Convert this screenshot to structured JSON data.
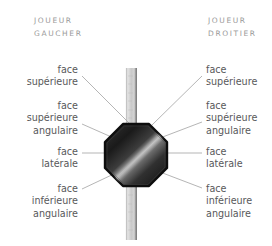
{
  "diagram": {
    "title_left": {
      "line1": "JOUEUR",
      "line2": "GAUCHER"
    },
    "title_right": {
      "line1": "JOUEUR",
      "line2": "DROITIER"
    },
    "colors": {
      "background": "#ffffff",
      "heading_text": "#9a9a9a",
      "label_text": "#58585a",
      "leader_line": "#a8a8a8",
      "bar_light": "#d9d9d9",
      "bar_mid": "#c4c4c4",
      "bar_dark": "#8e8e8e",
      "octagon_outline": "#0d0d0d",
      "octagon_dark": "#1b1b1b",
      "octagon_highlight": "#b9b9b9"
    },
    "labels_left": [
      {
        "id": "face-superieure",
        "lines": [
          "face",
          "supérieure"
        ]
      },
      {
        "id": "face-superieure-angulaire",
        "lines": [
          "face",
          "supérieure",
          "angulaire"
        ]
      },
      {
        "id": "face-laterale",
        "lines": [
          "face",
          "latérale"
        ]
      },
      {
        "id": "face-inferieure-angulaire",
        "lines": [
          "face",
          "inférieure",
          "angulaire"
        ]
      }
    ],
    "labels_right": [
      {
        "id": "face-superieure",
        "lines": [
          "face",
          "supérieure"
        ]
      },
      {
        "id": "face-superieure-angulaire",
        "lines": [
          "face",
          "supérieure",
          "angulaire"
        ]
      },
      {
        "id": "face-laterale",
        "lines": [
          "face",
          "latérale"
        ]
      },
      {
        "id": "face-inferieure-angulaire",
        "lines": [
          "face",
          "inférieure",
          "angulaire"
        ]
      }
    ],
    "shapes": {
      "bar": {
        "x": 126,
        "y": 68,
        "width": 11,
        "height": 172
      },
      "octagon": {
        "cx": 136,
        "cy": 155,
        "radius": 31
      }
    },
    "leader_lines": [
      {
        "id": "left-superieure",
        "x1": 82,
        "y1": 76,
        "x2": 130,
        "y2": 124
      },
      {
        "id": "left-superieure-angulaire",
        "x1": 82,
        "y1": 124,
        "x2": 116,
        "y2": 139
      },
      {
        "id": "left-laterale",
        "x1": 82,
        "y1": 153,
        "x2": 107,
        "y2": 153
      },
      {
        "id": "left-inferieure-angulaire",
        "x1": 82,
        "y1": 189,
        "x2": 118,
        "y2": 172
      },
      {
        "id": "right-superieure",
        "x1": 202,
        "y1": 76,
        "x2": 152,
        "y2": 125
      },
      {
        "id": "right-superieure-angulaire",
        "x1": 202,
        "y1": 122,
        "x2": 160,
        "y2": 138
      },
      {
        "id": "right-laterale",
        "x1": 202,
        "y1": 153,
        "x2": 168,
        "y2": 153
      },
      {
        "id": "right-inferieure-angulaire",
        "x1": 202,
        "y1": 188,
        "x2": 160,
        "y2": 172
      }
    ]
  }
}
